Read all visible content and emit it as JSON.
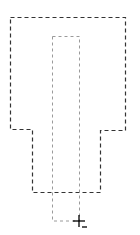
{
  "canvas": {
    "width": 140,
    "height": 235,
    "background": "#ffffff"
  },
  "outer_shape": {
    "type": "polygon",
    "points": "10.5,17.5 125.5,17.5 125.5,130.5 100.5,130.5 100.5,192.5 32.5,192.5 32.5,129.5 10.5,129.5",
    "stroke": "#333333",
    "dash": "4,3"
  },
  "inner_selection": {
    "type": "rect",
    "x": 52.5,
    "y": 36.5,
    "width": 27,
    "height": 184.5,
    "stroke": "#9a9a9a",
    "dash": "3,3"
  },
  "cursor": {
    "type": "crosshair-subtract",
    "x": 79,
    "y": 221,
    "modifier": "minus",
    "color": "#000000"
  }
}
